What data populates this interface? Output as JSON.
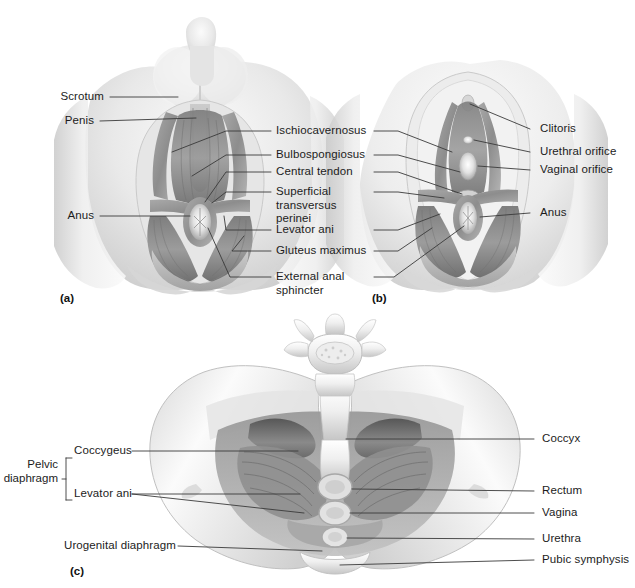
{
  "figure": {
    "background_color": "#ffffff",
    "text_color": "#1c1c1c",
    "leader_line_color": "#3a3a3a"
  },
  "panels": [
    {
      "id": "a",
      "letter": "(a)",
      "caption": "Male perineum, inferior view"
    },
    {
      "id": "b",
      "letter": "(b)",
      "caption": "Female perineum, inferior view"
    },
    {
      "id": "c",
      "letter": "(c)",
      "caption": "Pelvic diaphragm, superior view"
    }
  ],
  "labels": {
    "panel_a_left": [
      {
        "key": "scrotum",
        "text": "Scrotum"
      },
      {
        "key": "penis",
        "text": "Penis"
      },
      {
        "key": "anus_a",
        "text": "Anus"
      }
    ],
    "shared_center": [
      {
        "key": "ischiocavernosus",
        "text": "Ischiocavernosus"
      },
      {
        "key": "bulbospongiosus",
        "text": "Bulbospongiosus"
      },
      {
        "key": "central_tendon",
        "text": "Central tendon"
      },
      {
        "key": "superficial_transversus_perinei",
        "text": "Superficial\ntransversus\nperinei"
      },
      {
        "key": "levator_ani_ab",
        "text": "Levator ani"
      },
      {
        "key": "gluteus_maximus",
        "text": "Gluteus maximus"
      },
      {
        "key": "external_anal_sphincter",
        "text": "External anal\nsphincter"
      }
    ],
    "panel_b_right": [
      {
        "key": "clitoris",
        "text": "Clitoris"
      },
      {
        "key": "urethral_orifice",
        "text": "Urethral orifice"
      },
      {
        "key": "vaginal_orifice",
        "text": "Vaginal orifice"
      },
      {
        "key": "anus_b",
        "text": "Anus"
      }
    ],
    "panel_c_left": [
      {
        "key": "pelvic_diaphragm",
        "text": "Pelvic\ndiaphragm"
      },
      {
        "key": "coccygeus",
        "text": "Coccygeus"
      },
      {
        "key": "levator_ani_c",
        "text": "Levator ani"
      },
      {
        "key": "urogenital_diaphragm",
        "text": "Urogenital diaphragm"
      }
    ],
    "panel_c_right": [
      {
        "key": "coccyx",
        "text": "Coccyx"
      },
      {
        "key": "rectum",
        "text": "Rectum"
      },
      {
        "key": "vagina",
        "text": "Vagina"
      },
      {
        "key": "urethra",
        "text": "Urethra"
      },
      {
        "key": "pubic_symphysis",
        "text": "Pubic symphysis"
      }
    ]
  }
}
